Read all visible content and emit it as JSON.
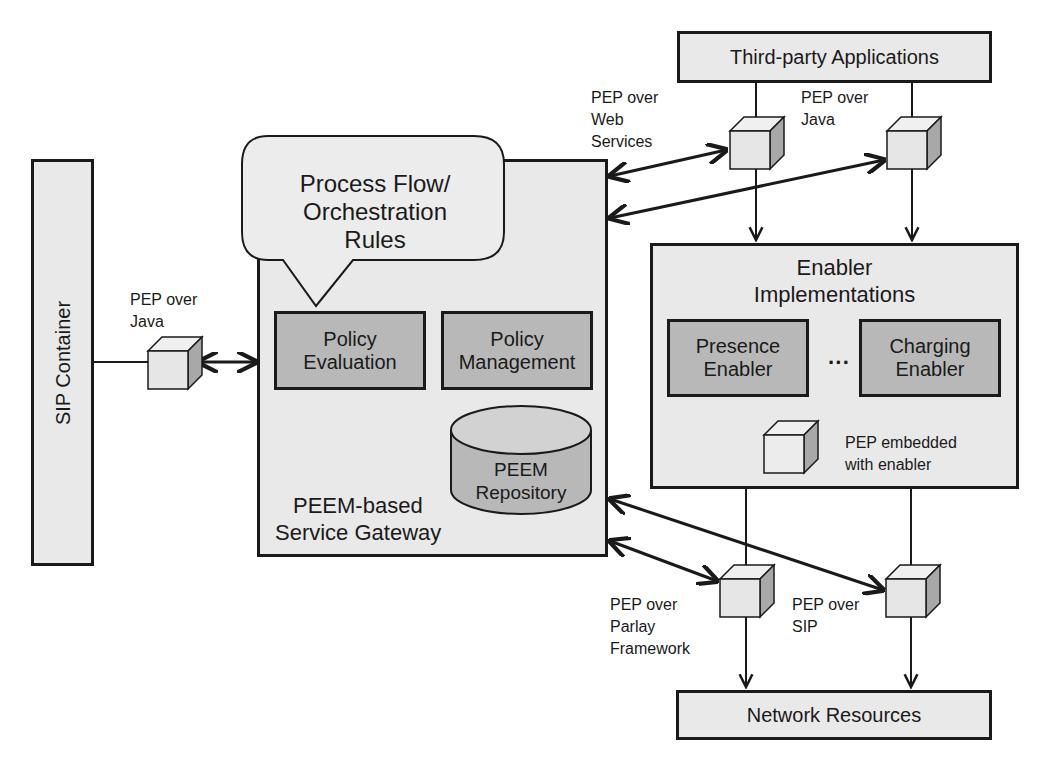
{
  "diagram": {
    "third_party": {
      "label": "Third-party Applications"
    },
    "sip_container": {
      "label": "SIP Container"
    },
    "gateway": {
      "label_line1": "PEEM-based",
      "label_line2": "Service Gateway",
      "bubble": {
        "line1": "Process Flow/",
        "line2": "Orchestration",
        "line3": "Rules"
      },
      "policy_evaluation": {
        "line1": "Policy",
        "line2": "Evaluation"
      },
      "policy_management": {
        "line1": "Policy",
        "line2": "Management"
      },
      "repository": {
        "line1": "PEEM",
        "line2": "Repository"
      }
    },
    "enablers": {
      "title_line1": "Enabler",
      "title_line2": "Implementations",
      "presence": {
        "line1": "Presence",
        "line2": "Enabler"
      },
      "charging": {
        "line1": "Charging",
        "line2": "Enabler"
      },
      "ellipsis": "···",
      "embedded_pep": {
        "line1": "PEP embedded",
        "line2": "with enabler"
      }
    },
    "network_resources": {
      "label": "Network Resources"
    },
    "pep_labels": {
      "sip_java": {
        "line1": "PEP over",
        "line2": "Java"
      },
      "web_services": {
        "line1": "PEP over",
        "line2": "Web",
        "line3": "Services"
      },
      "top_java": {
        "line1": "PEP over",
        "line2": "Java"
      },
      "parlay": {
        "line1": "PEP over",
        "line2": "Parlay",
        "line3": "Framework"
      },
      "sip": {
        "line1": "PEP over",
        "line2": "SIP"
      }
    },
    "colors": {
      "outline": "#1a1a1a",
      "light_fill": "#e9e9e9",
      "dark_fill": "#b8b8b8",
      "cube_front": "#e6e6e6",
      "cube_side": "#a8a8a8"
    }
  }
}
